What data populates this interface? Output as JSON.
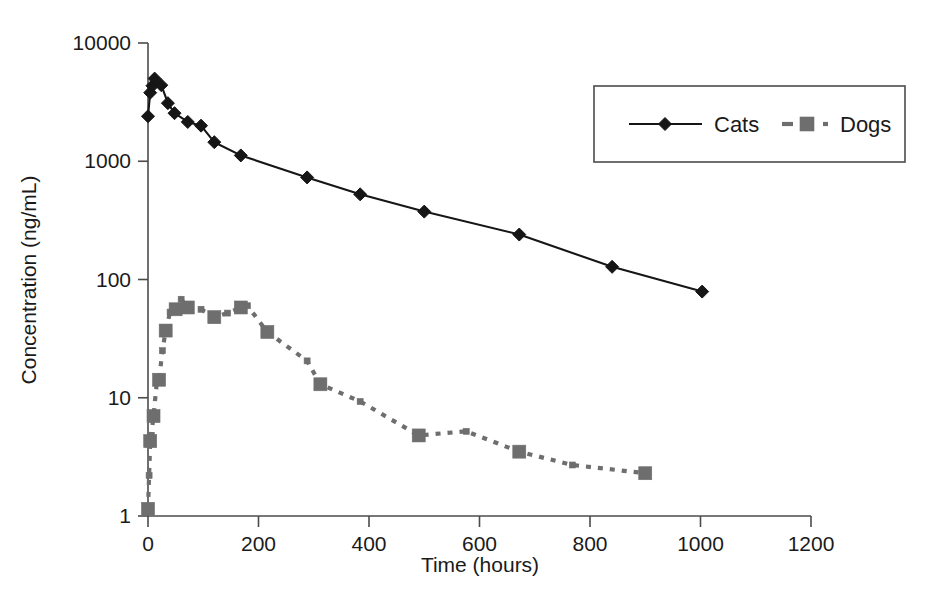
{
  "chart_data": {
    "type": "line",
    "title": "",
    "xlabel": "Time (hours)",
    "ylabel": "Concentration (ng/mL)",
    "xlim": [
      0,
      1200
    ],
    "ylim": [
      1,
      10000
    ],
    "yscale": "log",
    "xscale": "linear",
    "grid": false,
    "xticks": [
      0,
      200,
      400,
      600,
      800,
      1000,
      1200
    ],
    "xtick_labels": [
      "0",
      "200",
      "400",
      "600",
      "800",
      "1000",
      "1200"
    ],
    "yticks": [
      1,
      10,
      100,
      1000,
      10000
    ],
    "ytick_labels": [
      "1",
      "10",
      "100",
      "1000",
      "10000"
    ],
    "legend_position": "top-right",
    "series": [
      {
        "name": "Cats",
        "marker": "diamond",
        "line_style": "solid",
        "color": "#161616",
        "points": [
          [
            0,
            2400
          ],
          [
            4,
            3800
          ],
          [
            8,
            4350
          ],
          [
            12,
            5000
          ],
          [
            24,
            4400
          ],
          [
            36,
            3100
          ],
          [
            48,
            2550
          ],
          [
            72,
            2150
          ],
          [
            96,
            2000
          ],
          [
            120,
            1450
          ],
          [
            168,
            1120
          ],
          [
            288,
            730
          ],
          [
            384,
            525
          ],
          [
            500,
            375
          ],
          [
            672,
            240
          ],
          [
            840,
            128
          ],
          [
            1003,
            79
          ]
        ]
      },
      {
        "name": "Dogs",
        "marker": "square",
        "line_style": "dashed",
        "color": "#6e6e6e",
        "points": [
          [
            0,
            1.15
          ],
          [
            2,
            2.2
          ],
          [
            4,
            4.3
          ],
          [
            6,
            4.8
          ],
          [
            10,
            7.0
          ],
          [
            16,
            13.5
          ],
          [
            20,
            14.2
          ],
          [
            26,
            25.0
          ],
          [
            32,
            37.0
          ],
          [
            40,
            53.0
          ],
          [
            50,
            56.0
          ],
          [
            60,
            68.0
          ],
          [
            72,
            58.0
          ],
          [
            96,
            56.0
          ],
          [
            120,
            48.0
          ],
          [
            144,
            52.0
          ],
          [
            168,
            58.0
          ],
          [
            180,
            60.0
          ],
          [
            216,
            36.0
          ],
          [
            288,
            20.5
          ],
          [
            312,
            13.0
          ],
          [
            384,
            9.3
          ],
          [
            490,
            4.8
          ],
          [
            576,
            5.2
          ],
          [
            672,
            3.5
          ],
          [
            768,
            2.7
          ],
          [
            900,
            2.3
          ]
        ]
      }
    ]
  },
  "legend": {
    "entries": [
      {
        "label": "Cats"
      },
      {
        "label": "Dogs"
      }
    ]
  },
  "axes": {
    "x_title": "Time (hours)",
    "y_title": "Concentration (ng/mL)"
  }
}
